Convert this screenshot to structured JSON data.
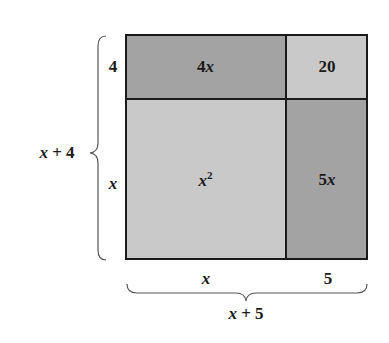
{
  "diagram": {
    "type": "area-model",
    "colors": {
      "dark_region": "#a3a3a3",
      "light_region": "#c9c9c9",
      "lines": "#1a1a1a"
    },
    "regions": {
      "top_left": {
        "label_coef": "4",
        "label_var": "x",
        "shade": "dark"
      },
      "top_right": {
        "label": "20",
        "shade": "light"
      },
      "bottom_left": {
        "label_var": "x",
        "label_exp": "2",
        "shade": "light"
      },
      "bottom_right": {
        "label_coef": "5",
        "label_var": "x",
        "shade": "dark"
      }
    },
    "side_labels": {
      "top_row": "4",
      "bottom_row": "x",
      "left_column": "x",
      "right_column": "5"
    },
    "left_brace": {
      "var": "x",
      "op": "+",
      "const": "4"
    },
    "bottom_brace": {
      "var": "x",
      "op": "+",
      "const": "5"
    }
  }
}
